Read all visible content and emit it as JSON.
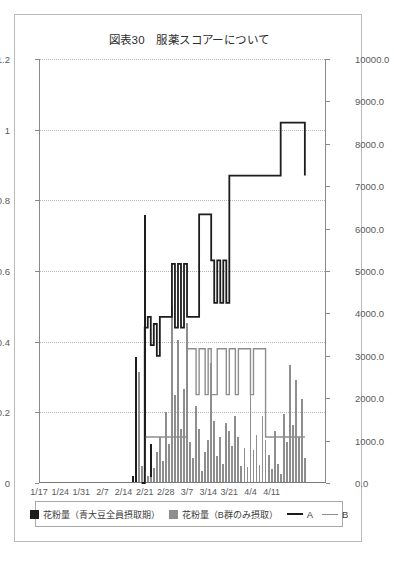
{
  "figure": {
    "title": "図表30　服薬スコアーについて"
  },
  "axes": {
    "left": {
      "ticks": [
        "0",
        "0.2",
        "0.4",
        "0.6",
        "0.8",
        "1",
        "1.2"
      ],
      "min": 0,
      "max": 1.2
    },
    "right": {
      "ticks": [
        "0.0",
        "1000.0",
        "2000.0",
        "3000.0",
        "4000.0",
        "5000.0",
        "6000.0",
        "7000.0",
        "8000.0",
        "9000.0",
        "10000.0"
      ],
      "min": 0,
      "max": 10000
    },
    "x": {
      "ticks": [
        "1/17",
        "1/24",
        "1/31",
        "2/7",
        "2/14",
        "2/21",
        "2/28",
        "3/7",
        "3/14",
        "3/21",
        "4/4",
        "4/11"
      ]
    }
  },
  "legend": {
    "items": [
      {
        "label": "花粉量（青大豆全員摂取期）",
        "marker": "bar-dark-swatch",
        "color": "#1d1d1d"
      },
      {
        "label": "花粉量（B群のみ摂取）",
        "marker": "bar-gray-swatch",
        "color": "#8e8e8e"
      },
      {
        "label": "A",
        "marker": "line-dark-swatch",
        "color": "#1d1d1d"
      },
      {
        "label": "B",
        "marker": "line-gray-swatch",
        "color": "#8e8e8e"
      }
    ]
  },
  "chart_data": {
    "type": "bar",
    "title": "図表30　服薬スコアーについて",
    "xlabel": "",
    "ylabel": "",
    "grid": true,
    "legend_position": "bottom",
    "xlim": [
      0,
      95
    ],
    "ylim_left": [
      0,
      1.2
    ],
    "ylim_right": [
      0,
      10000
    ],
    "xtick_labels": [
      "1/17",
      "1/24",
      "1/31",
      "2/7",
      "2/14",
      "2/21",
      "2/28",
      "3/7",
      "3/14",
      "3/21",
      "4/4",
      "4/11"
    ],
    "xtick_positions": [
      0,
      7,
      14,
      21,
      28,
      35,
      42,
      49,
      56,
      63,
      70,
      77
    ],
    "ytick_labels_left": [
      "0",
      "0.2",
      "0.4",
      "0.6",
      "0.8",
      "1",
      "1.2"
    ],
    "ytick_labels_right": [
      "0.0",
      "1000.0",
      "2000.0",
      "3000.0",
      "4000.0",
      "5000.0",
      "6000.0",
      "7000.0",
      "8000.0",
      "9000.0",
      "10000.0"
    ],
    "series": [
      {
        "name": "花粉量（青大豆全員摂取期）",
        "type": "bar",
        "axis": "right",
        "color": "#1d1d1d",
        "x": [
          31,
          32,
          33,
          34,
          35,
          36,
          37,
          38,
          39,
          40
        ],
        "values": [
          140,
          2950,
          520,
          330,
          6300,
          80,
          900,
          60,
          240,
          30
        ]
      },
      {
        "name": "花粉量（B群のみ摂取）",
        "type": "bar",
        "axis": "right",
        "color": "#8e8e8e",
        "x": [
          33,
          34,
          35,
          36,
          37,
          38,
          39,
          40,
          41,
          42,
          43,
          44,
          45,
          46,
          47,
          48,
          49,
          50,
          51,
          52,
          53,
          54,
          55,
          56,
          57,
          58,
          59,
          60,
          61,
          62,
          63,
          64,
          65,
          66,
          67,
          68,
          69,
          70,
          71,
          72,
          73,
          74,
          75,
          76,
          77,
          78,
          79,
          80,
          81,
          82,
          83,
          84,
          85,
          86,
          87,
          88
        ],
        "values": [
          2600,
          380,
          260,
          150,
          120,
          340,
          700,
          1050,
          500,
          1650,
          900,
          4150,
          2050,
          3350,
          1250,
          2200,
          3750,
          950,
          560,
          1800,
          1250,
          250,
          700,
          980,
          2800,
          1450,
          620,
          1050,
          420,
          1400,
          1200,
          850,
          1550,
          1050,
          380,
          800,
          350,
          2350,
          750,
          1100,
          400,
          1550,
          1000,
          640,
          300,
          1200,
          430,
          200,
          1600,
          950,
          2750,
          1350,
          2400,
          1050,
          1950,
          560
        ]
      },
      {
        "name": "A",
        "type": "line",
        "axis": "left",
        "color": "#1d1d1d",
        "x": [
          34,
          35,
          36,
          37,
          38,
          39,
          40,
          41,
          42,
          43,
          44,
          45,
          46,
          47,
          48,
          49,
          50,
          51,
          52,
          53,
          54,
          55,
          56,
          57,
          58,
          59,
          60,
          61,
          62,
          63,
          64,
          65,
          66,
          67,
          68,
          69,
          70,
          71,
          72,
          73,
          74,
          75,
          76,
          77,
          78,
          79,
          80,
          81,
          82,
          83,
          84,
          85,
          86,
          87,
          88
        ],
        "values": [
          0.0,
          0.44,
          0.47,
          0.39,
          0.45,
          0.36,
          0.47,
          0.47,
          0.47,
          0.47,
          0.62,
          0.44,
          0.62,
          0.44,
          0.62,
          0.47,
          0.47,
          0.47,
          0.47,
          0.76,
          0.76,
          0.76,
          0.76,
          0.63,
          0.51,
          0.63,
          0.51,
          0.63,
          0.51,
          0.87,
          0.87,
          0.87,
          0.87,
          0.87,
          0.87,
          0.87,
          0.87,
          0.87,
          0.87,
          0.87,
          0.87,
          0.87,
          0.87,
          0.87,
          0.87,
          0.87,
          1.02,
          1.02,
          1.02,
          1.02,
          1.02,
          1.02,
          1.02,
          1.02,
          0.87
        ]
      },
      {
        "name": "B",
        "type": "line",
        "axis": "left",
        "color": "#8e8e8e",
        "x": [
          34,
          35,
          36,
          37,
          38,
          39,
          40,
          41,
          42,
          43,
          44,
          45,
          46,
          47,
          48,
          49,
          50,
          51,
          52,
          53,
          54,
          55,
          56,
          57,
          58,
          59,
          60,
          61,
          62,
          63,
          64,
          65,
          66,
          67,
          68,
          69,
          70,
          71,
          72,
          73,
          74,
          75,
          76,
          77,
          78,
          79,
          80,
          81,
          82,
          83,
          84,
          85,
          86,
          87,
          88
        ],
        "values": [
          0.0,
          0.13,
          0.13,
          0.13,
          0.13,
          0.13,
          0.13,
          0.13,
          0.13,
          0.13,
          0.13,
          0.13,
          0.13,
          0.13,
          0.13,
          0.38,
          0.38,
          0.38,
          0.25,
          0.38,
          0.38,
          0.25,
          0.38,
          0.25,
          0.25,
          0.38,
          0.38,
          0.38,
          0.25,
          0.38,
          0.38,
          0.25,
          0.38,
          0.38,
          0.38,
          0.38,
          0.25,
          0.38,
          0.38,
          0.38,
          0.38,
          0.13,
          0.13,
          0.13,
          0.13,
          0.13,
          0.13,
          0.13,
          0.13,
          0.13,
          0.13,
          0.13,
          0.13,
          0.13,
          0.13
        ]
      }
    ]
  }
}
